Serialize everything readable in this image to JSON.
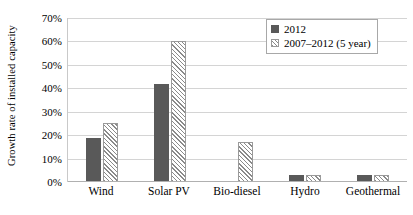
{
  "chart_data": {
    "type": "bar",
    "title": "",
    "xlabel": "",
    "ylabel": "Growth rate of installed capacity",
    "ylim": [
      0,
      70
    ],
    "ytick_labels": [
      "70%",
      "60%",
      "50%",
      "40%",
      "30%",
      "20%",
      "10%",
      "0%"
    ],
    "ytick_values": [
      70,
      60,
      50,
      40,
      30,
      20,
      10,
      0
    ],
    "grid": true,
    "legend_position": "top-right",
    "categories": [
      "Wind",
      "Solar PV",
      "Bio-diesel",
      "Hydro",
      "Geothermal"
    ],
    "series": [
      {
        "name": "2012",
        "style": "solid",
        "color": "#595959",
        "values": [
          19,
          42,
          0.5,
          3,
          3
        ]
      },
      {
        "name": "2007–2012 (5 year)",
        "style": "hatched",
        "color": "#8a8a8a",
        "values": [
          25,
          60,
          17,
          3,
          3
        ]
      }
    ]
  },
  "legend": {
    "items": [
      {
        "label": "2012",
        "swatch": "solid-square-icon"
      },
      {
        "label": "2007–2012 (5 year)",
        "swatch": "hatched-square-icon"
      }
    ]
  }
}
